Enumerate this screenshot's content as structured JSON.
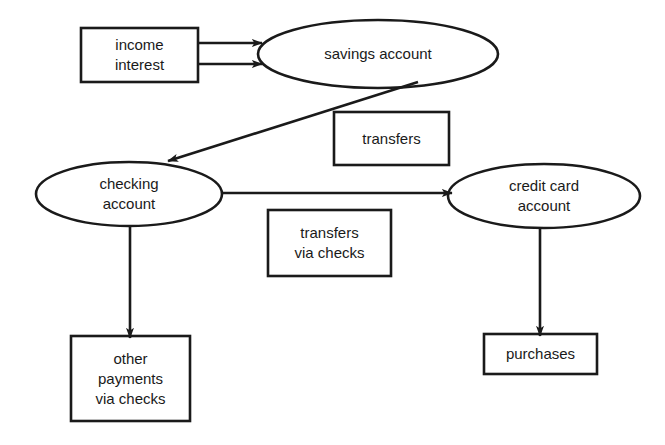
{
  "diagram": {
    "background_color": "#ffffff",
    "stroke_color": "#1a1a1a",
    "text_color": "#1a1a1a",
    "nodes": [
      {
        "id": "income-interest",
        "shape": "rectangle",
        "lines": [
          "income",
          "interest"
        ],
        "text": "income\ninterest",
        "x": 81,
        "y": 28,
        "w": 117,
        "h": 54
      },
      {
        "id": "savings-account",
        "shape": "ellipse",
        "lines": [
          "savings account"
        ],
        "text": "savings account",
        "cx": 378,
        "cy": 54,
        "rx": 120,
        "ry": 34
      },
      {
        "id": "transfers",
        "shape": "rectangle",
        "lines": [
          "transfers"
        ],
        "text": "transfers",
        "x": 334,
        "y": 112,
        "w": 115,
        "h": 53
      },
      {
        "id": "checking-account",
        "shape": "ellipse",
        "lines": [
          "checking",
          "account"
        ],
        "text": "checking\naccount",
        "cx": 129,
        "cy": 194,
        "rx": 93,
        "ry": 32
      },
      {
        "id": "credit-card-account",
        "shape": "ellipse",
        "lines": [
          "credit card",
          "account"
        ],
        "text": "credit card\naccount",
        "cx": 544,
        "cy": 196,
        "rx": 96,
        "ry": 32
      },
      {
        "id": "transfers-via-checks",
        "shape": "rectangle",
        "lines": [
          "transfers",
          "via checks"
        ],
        "text": "transfers\nvia checks",
        "x": 268,
        "y": 210,
        "w": 123,
        "h": 66
      },
      {
        "id": "other-payments-via-checks",
        "shape": "rectangle",
        "lines": [
          "other",
          "payments",
          "via checks"
        ],
        "text": "other\npayments\nvia checks",
        "x": 71,
        "y": 336,
        "w": 119,
        "h": 85
      },
      {
        "id": "purchases",
        "shape": "rectangle",
        "lines": [
          "purchases"
        ],
        "text": "purchases",
        "x": 484,
        "y": 334,
        "w": 113,
        "h": 40
      }
    ],
    "edges": [
      {
        "id": "income-to-savings",
        "from": "income-interest",
        "to": "savings-account",
        "label": ""
      },
      {
        "id": "interest-to-savings",
        "from": "income-interest",
        "to": "savings-account",
        "label": ""
      },
      {
        "id": "savings-to-checking",
        "from": "savings-account",
        "to": "checking-account",
        "label": "transfers"
      },
      {
        "id": "checking-to-credit-card",
        "from": "checking-account",
        "to": "credit-card-account",
        "label": "transfers via checks"
      },
      {
        "id": "checking-to-other-payments",
        "from": "checking-account",
        "to": "other-payments-via-checks",
        "label": ""
      },
      {
        "id": "credit-card-to-purchases",
        "from": "credit-card-account",
        "to": "purchases",
        "label": ""
      }
    ]
  }
}
